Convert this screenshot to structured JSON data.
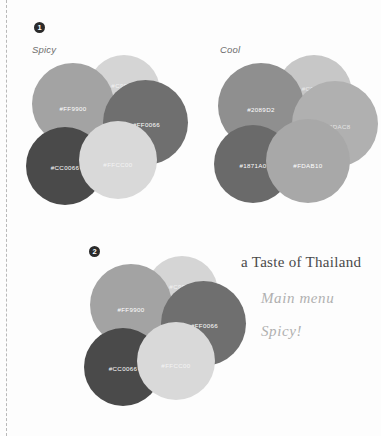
{
  "document": {
    "background_color": "#fdfdfd",
    "margin_rule_color": "#b9b9b9"
  },
  "sections": [
    {
      "badge": "1",
      "title": "Spicy",
      "swatches": [
        {
          "label": "#FF9900",
          "render_color": "#a3a3a3",
          "text_color": "#ffffff"
        },
        {
          "label": "#C9FBE6",
          "render_color": "#d5d5d5",
          "text_color": "#f2f2f2"
        },
        {
          "label": "#FF0066",
          "render_color": "#6f6f6f",
          "text_color": "#ffffff"
        },
        {
          "label": "#CC0066",
          "render_color": "#4a4a4a",
          "text_color": "#ffffff"
        },
        {
          "label": "#FFCC00",
          "render_color": "#d9d9d9",
          "text_color": "#f4f4f4"
        }
      ]
    },
    {
      "badge": "",
      "title": "Cool",
      "swatches": [
        {
          "label": "#2089D2",
          "render_color": "#8f8f8f",
          "text_color": "#ffffff"
        },
        {
          "label": "#C9FFF2",
          "render_color": "#c7c7c7",
          "text_color": "#ececec"
        },
        {
          "label": "#23DAC8",
          "render_color": "#b0b0b0",
          "text_color": "#e4e4e4"
        },
        {
          "label": "#1871A0",
          "render_color": "#6a6a6a",
          "text_color": "#ffffff"
        },
        {
          "label": "#FDAB10",
          "render_color": "#a8a8a8",
          "text_color": "#ffffff"
        }
      ]
    },
    {
      "badge": "2",
      "title": "",
      "swatches": [
        {
          "label": "#FF9900",
          "render_color": "#a3a3a3",
          "text_color": "#ffffff"
        },
        {
          "label": "#C9FBE6",
          "render_color": "#d5d5d5",
          "text_color": "#f2f2f2"
        },
        {
          "label": "#FF0066",
          "render_color": "#6f6f6f",
          "text_color": "#ffffff"
        },
        {
          "label": "#CC0066",
          "render_color": "#4a4a4a",
          "text_color": "#ffffff"
        },
        {
          "label": "#FFCC00",
          "render_color": "#d9d9d9",
          "text_color": "#f4f4f4"
        }
      ]
    }
  ],
  "annotations": {
    "heading": "a Taste of Thailand",
    "line_one": "Main menu",
    "line_two": "Spicy!"
  }
}
